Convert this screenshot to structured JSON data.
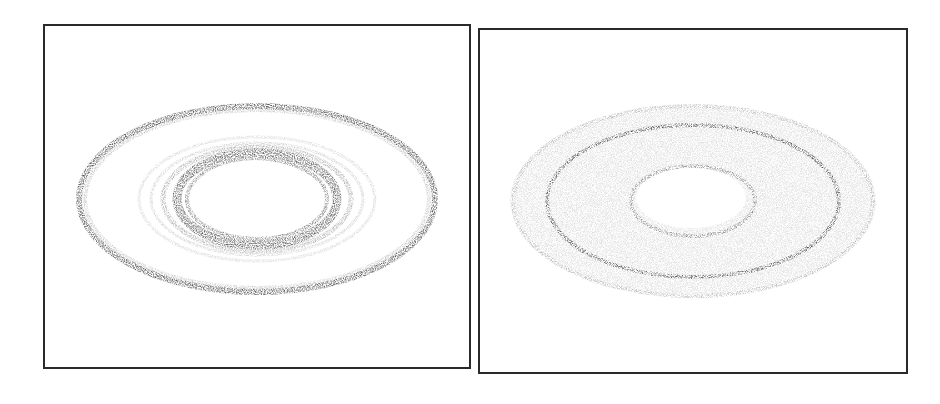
{
  "figure": {
    "panels": [
      {
        "id": "left",
        "description": "Particle disk with thin dark outer ring and dense inner ring around central cavity",
        "frame": {
          "x": 43,
          "y": 24,
          "w": 428,
          "h": 345
        },
        "center": [
          257,
          199
        ],
        "rings": [
          {
            "rx": 178,
            "ry": 93,
            "width": 6,
            "opacity": 0.75
          },
          {
            "rx": 172,
            "ry": 89,
            "width": 4,
            "opacity": 0.25
          },
          {
            "rx": 118,
            "ry": 62,
            "width": 3,
            "opacity": 0.18
          },
          {
            "rx": 106,
            "ry": 56,
            "width": 3,
            "opacity": 0.2
          },
          {
            "rx": 94,
            "ry": 52,
            "width": 5,
            "opacity": 0.35
          },
          {
            "rx": 80,
            "ry": 46,
            "width": 9,
            "opacity": 0.7
          },
          {
            "rx": 70,
            "ry": 40,
            "width": 4,
            "opacity": 0.55
          }
        ],
        "cavity": {
          "rx": 63,
          "ry": 36
        }
      },
      {
        "id": "right",
        "description": "Broad diffuse particle disk with one sharp dark ring and small central cavity",
        "frame": {
          "x": 478,
          "y": 28,
          "w": 430,
          "h": 346
        },
        "center": [
          693,
          201
        ],
        "fill_disk": {
          "rx": 183,
          "ry": 97,
          "opacity": 0.16
        },
        "rings": [
          {
            "rx": 146,
            "ry": 76,
            "width": 4,
            "opacity": 0.75
          },
          {
            "rx": 180,
            "ry": 95,
            "width": 4,
            "opacity": 0.2
          },
          {
            "rx": 62,
            "ry": 35,
            "width": 4,
            "opacity": 0.45
          }
        ],
        "cavity": {
          "rx": 55,
          "ry": 30
        }
      }
    ],
    "colors": {
      "ink": "#2a2a2a",
      "background": "#ffffff"
    }
  }
}
